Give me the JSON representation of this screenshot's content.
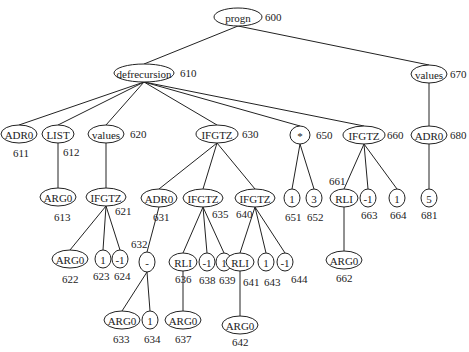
{
  "diagram": {
    "title": "",
    "nodes": [
      {
        "key": "600",
        "label": "progn",
        "x": 238,
        "y": 17,
        "rx": 24,
        "ry": 9,
        "id_label": "600",
        "id_x": 265,
        "id_y": 21,
        "parent": null
      },
      {
        "key": "610",
        "label": "defrecursion",
        "x": 144,
        "y": 73,
        "rx": 30,
        "ry": 9,
        "id_label": "610",
        "id_x": 180,
        "id_y": 77,
        "parent": "600"
      },
      {
        "key": "670",
        "label": "values",
        "x": 429,
        "y": 74,
        "rx": 18,
        "ry": 9,
        "id_label": "670",
        "id_x": 450,
        "id_y": 78,
        "parent": "600"
      },
      {
        "key": "611",
        "label": "ADR0",
        "x": 19,
        "y": 134,
        "rx": 18,
        "ry": 9,
        "id_label": "611",
        "id_x": 13,
        "id_y": 157,
        "parent": "610"
      },
      {
        "key": "612",
        "label": "LIST",
        "x": 58,
        "y": 134,
        "rx": 16,
        "ry": 9,
        "id_label": "612",
        "id_x": 63,
        "id_y": 156,
        "parent": "610"
      },
      {
        "key": "620",
        "label": "values",
        "x": 106,
        "y": 134,
        "rx": 18,
        "ry": 9,
        "id_label": "620",
        "id_x": 130,
        "id_y": 138,
        "parent": "610"
      },
      {
        "key": "630",
        "label": "IFGTZ",
        "x": 217,
        "y": 134,
        "rx": 21,
        "ry": 9,
        "id_label": "630",
        "id_x": 242,
        "id_y": 138,
        "parent": "610"
      },
      {
        "key": "650",
        "label": "*",
        "x": 300,
        "y": 135,
        "rx": 10,
        "ry": 9,
        "id_label": "650",
        "id_x": 316,
        "id_y": 139,
        "parent": "610"
      },
      {
        "key": "660",
        "label": "IFGTZ",
        "x": 364,
        "y": 135,
        "rx": 21,
        "ry": 9,
        "id_label": "660",
        "id_x": 387,
        "id_y": 139,
        "parent": "610"
      },
      {
        "key": "680",
        "label": "ADR0",
        "x": 429,
        "y": 135,
        "rx": 18,
        "ry": 9,
        "id_label": "680",
        "id_x": 450,
        "id_y": 139,
        "parent": "670"
      },
      {
        "key": "613",
        "label": "ARG0",
        "x": 58,
        "y": 197,
        "rx": 18,
        "ry": 9,
        "id_label": "613",
        "id_x": 54,
        "id_y": 221,
        "parent": "612"
      },
      {
        "key": "621",
        "label": "IFGTZ",
        "x": 106,
        "y": 197,
        "rx": 20,
        "ry": 9,
        "id_label": "621",
        "id_x": 115,
        "id_y": 215,
        "parent": "620"
      },
      {
        "key": "631",
        "label": "ADR0",
        "x": 159,
        "y": 198,
        "rx": 18,
        "ry": 9,
        "id_label": "631",
        "id_x": 153,
        "id_y": 221,
        "parent": "630"
      },
      {
        "key": "635",
        "label": "IFGTZ",
        "x": 203,
        "y": 198,
        "rx": 20,
        "ry": 9,
        "id_label": "635",
        "id_x": 212,
        "id_y": 218,
        "parent": "630"
      },
      {
        "key": "640",
        "label": "IFGTZ",
        "x": 255,
        "y": 198,
        "rx": 20,
        "ry": 9,
        "id_label": "640",
        "id_x": 236,
        "id_y": 218,
        "parent": "630"
      },
      {
        "key": "651",
        "label": "1",
        "x": 292,
        "y": 198,
        "rx": 8,
        "ry": 9,
        "id_label": "651",
        "id_x": 285,
        "id_y": 221,
        "parent": "650"
      },
      {
        "key": "652",
        "label": "3",
        "x": 314,
        "y": 198,
        "rx": 8,
        "ry": 9,
        "id_label": "652",
        "id_x": 307,
        "id_y": 221,
        "parent": "650"
      },
      {
        "key": "661",
        "label": "RLI",
        "x": 344,
        "y": 198,
        "rx": 14,
        "ry": 9,
        "id_label": "661",
        "id_x": 329,
        "id_y": 185,
        "parent": "660"
      },
      {
        "key": "663",
        "label": "-1",
        "x": 368,
        "y": 198,
        "rx": 8,
        "ry": 9,
        "id_label": "663",
        "id_x": 361,
        "id_y": 219,
        "parent": "660"
      },
      {
        "key": "664",
        "label": "1",
        "x": 397,
        "y": 198,
        "rx": 8,
        "ry": 9,
        "id_label": "664",
        "id_x": 390,
        "id_y": 219,
        "parent": "660"
      },
      {
        "key": "681",
        "label": "5",
        "x": 429,
        "y": 198,
        "rx": 8,
        "ry": 9,
        "id_label": "681",
        "id_x": 421,
        "id_y": 219,
        "parent": "680"
      },
      {
        "key": "622",
        "label": "ARG0",
        "x": 70,
        "y": 259,
        "rx": 18,
        "ry": 9,
        "id_label": "622",
        "id_x": 62,
        "id_y": 283,
        "parent": "621"
      },
      {
        "key": "623",
        "label": "1",
        "x": 103,
        "y": 259,
        "rx": 8,
        "ry": 9,
        "id_label": "623",
        "id_x": 93,
        "id_y": 280,
        "parent": "621"
      },
      {
        "key": "624",
        "label": "-1",
        "x": 120,
        "y": 259,
        "rx": 8,
        "ry": 9,
        "id_label": "624",
        "id_x": 114,
        "id_y": 280,
        "parent": "621"
      },
      {
        "key": "632",
        "label": "-",
        "x": 147,
        "y": 262,
        "rx": 8,
        "ry": 10,
        "id_label": "632",
        "id_x": 131,
        "id_y": 248,
        "parent": "631"
      },
      {
        "key": "636",
        "label": "RLI",
        "x": 183,
        "y": 262,
        "rx": 14,
        "ry": 9,
        "id_label": "636",
        "id_x": 175,
        "id_y": 283,
        "parent": "635"
      },
      {
        "key": "638",
        "label": "-1",
        "x": 207,
        "y": 262,
        "rx": 8,
        "ry": 9,
        "id_label": "638",
        "id_x": 199,
        "id_y": 284,
        "parent": "635"
      },
      {
        "key": "639",
        "label": "1",
        "x": 224,
        "y": 262,
        "rx": 8,
        "ry": 9,
        "id_label": "639",
        "id_x": 219,
        "id_y": 284,
        "parent": "635"
      },
      {
        "key": "641",
        "label": "RLI",
        "x": 240,
        "y": 262,
        "rx": 14,
        "ry": 9,
        "id_label": "641",
        "id_x": 243,
        "id_y": 286,
        "parent": "640"
      },
      {
        "key": "643",
        "label": "1",
        "x": 266,
        "y": 262,
        "rx": 8,
        "ry": 9,
        "id_label": "643",
        "id_x": 264,
        "id_y": 286,
        "parent": "640"
      },
      {
        "key": "644",
        "label": "-1",
        "x": 285,
        "y": 262,
        "rx": 8,
        "ry": 9,
        "id_label": "644",
        "id_x": 291,
        "id_y": 283,
        "parent": "640"
      },
      {
        "key": "662",
        "label": "ARG0",
        "x": 344,
        "y": 260,
        "rx": 18,
        "ry": 9,
        "id_label": "662",
        "id_x": 336,
        "id_y": 282,
        "parent": "661"
      },
      {
        "key": "633",
        "label": "ARG0",
        "x": 122,
        "y": 320,
        "rx": 18,
        "ry": 9,
        "id_label": "633",
        "id_x": 113,
        "id_y": 343,
        "parent": "632"
      },
      {
        "key": "634",
        "label": "1",
        "x": 150,
        "y": 320,
        "rx": 8,
        "ry": 9,
        "id_label": "634",
        "id_x": 144,
        "id_y": 343,
        "parent": "632"
      },
      {
        "key": "637",
        "label": "ARG0",
        "x": 183,
        "y": 320,
        "rx": 18,
        "ry": 9,
        "id_label": "637",
        "id_x": 175,
        "id_y": 343,
        "parent": "636"
      },
      {
        "key": "642",
        "label": "ARG0",
        "x": 240,
        "y": 325,
        "rx": 18,
        "ry": 9,
        "id_label": "642",
        "id_x": 232,
        "id_y": 346,
        "parent": "641"
      }
    ]
  }
}
